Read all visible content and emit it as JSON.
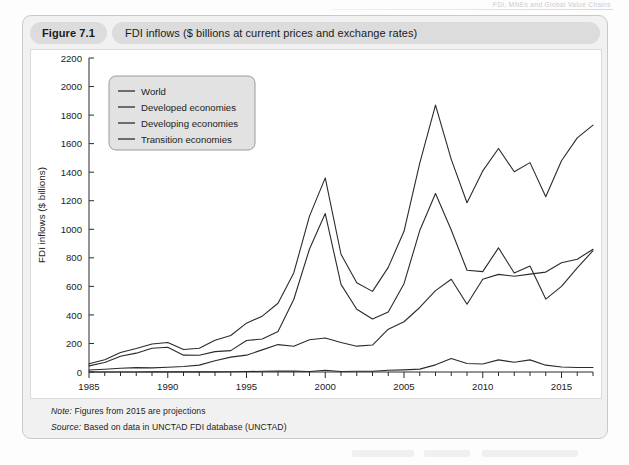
{
  "running_head": "FDI, MNEs and Global Value Chains",
  "figure": {
    "number": "Figure 7.1",
    "title": "FDI inflows ($ billions at current prices and exchange rates)"
  },
  "notes": {
    "note_label": "Note:",
    "note_text": " Figures from 2015 are projections",
    "source_label": "Source:",
    "source_text": " Based on data in UNCTAD FDI database (UNCTAD)"
  },
  "chart_data": {
    "type": "line",
    "title": "FDI inflows ($ billions at current prices and exchange rates)",
    "xlabel": "",
    "ylabel": "FDI inflows ($ billions)",
    "xlim": [
      1985,
      2017
    ],
    "ylim": [
      0,
      2200
    ],
    "ytick_step": 200,
    "yticks": [
      0,
      200,
      400,
      600,
      800,
      1000,
      1200,
      1400,
      1600,
      1800,
      2000,
      2200
    ],
    "xticks_major": [
      1985,
      1990,
      1995,
      2000,
      2005,
      2010,
      2015
    ],
    "xtick_minor_step": 1,
    "grid": false,
    "legend_position": "upper-left-inside",
    "line_color": "#2b2b2b",
    "x": [
      1985,
      1986,
      1987,
      1988,
      1989,
      1990,
      1991,
      1992,
      1993,
      1994,
      1995,
      1996,
      1997,
      1998,
      1999,
      2000,
      2001,
      2002,
      2003,
      2004,
      2005,
      2006,
      2007,
      2008,
      2009,
      2010,
      2011,
      2012,
      2013,
      2014,
      2015,
      2016,
      2017
    ],
    "series": [
      {
        "name": "World",
        "values": [
          58,
          86,
          137,
          164,
          196,
          207,
          158,
          166,
          223,
          256,
          342,
          391,
          482,
          694,
          1092,
          1360,
          825,
          626,
          565,
          733,
          986,
          1463,
          1870,
          1490,
          1186,
          1409,
          1566,
          1403,
          1467,
          1228,
          1480,
          1640,
          1730
        ]
      },
      {
        "name": "Developed economies",
        "values": [
          43,
          66,
          110,
          132,
          166,
          173,
          118,
          117,
          143,
          150,
          221,
          231,
          284,
          508,
          862,
          1110,
          614,
          440,
          371,
          421,
          619,
          991,
          1250,
          995,
          713,
          703,
          870,
          694,
          742,
          511,
          600,
          730,
          850
        ]
      },
      {
        "name": "Developing economies",
        "values": [
          14,
          19,
          26,
          31,
          29,
          33,
          39,
          48,
          79,
          104,
          118,
          155,
          192,
          180,
          226,
          238,
          207,
          181,
          189,
          300,
          352,
          452,
          570,
          650,
          475,
          650,
          684,
          671,
          686,
          700,
          765,
          790,
          860
        ]
      },
      {
        "name": "Transition economies",
        "values": [
          0,
          0,
          0,
          0,
          1,
          1,
          1,
          1,
          1,
          2,
          3,
          5,
          6,
          6,
          4,
          12,
          4,
          5,
          5,
          12,
          15,
          20,
          50,
          95,
          60,
          56,
          85,
          68,
          85,
          48,
          35,
          32,
          32
        ]
      }
    ],
    "legend": [
      "World",
      "Developed economies",
      "Developing economies",
      "Transition economies"
    ]
  }
}
